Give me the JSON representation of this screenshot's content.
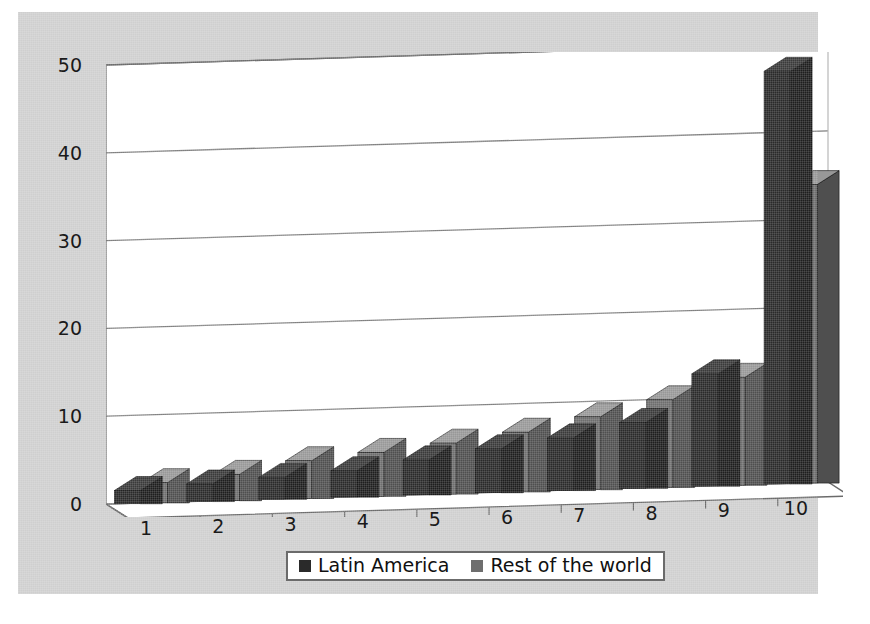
{
  "chart_data": {
    "type": "bar",
    "title": "",
    "subtitle": "",
    "xlabel": "",
    "ylabel": "",
    "categories": [
      "1",
      "2",
      "3",
      "4",
      "5",
      "6",
      "7",
      "8",
      "9",
      "10"
    ],
    "series": [
      {
        "name": "Latin America",
        "color": "#2a2a2a",
        "values": [
          1.5,
          2.0,
          2.5,
          3.0,
          4.0,
          5.0,
          6.0,
          7.5,
          12.8,
          47.0
        ]
      },
      {
        "name": "Rest of the world",
        "color": "#6e6e6e",
        "values": [
          2.3,
          3.0,
          4.3,
          5.0,
          5.8,
          6.8,
          8.3,
          10.0,
          12.3,
          34.0
        ]
      }
    ],
    "ylim": [
      0,
      50
    ],
    "yticks": [
      0,
      10,
      20,
      30,
      40,
      50
    ],
    "ytick_labels": [
      "0",
      "10",
      "20",
      "30",
      "40",
      "50"
    ],
    "grid": true,
    "legend_position": "bottom",
    "style": "3d-bar",
    "background": "#cfcfcf",
    "plot_background": "#ffffff",
    "axis_color": "#6b6b6b",
    "grid_color": "#808080"
  },
  "legend": {
    "items": [
      {
        "label": "Latin America",
        "swatch": "#2a2a2a",
        "icon": "square-swatch"
      },
      {
        "label": "Rest of the world",
        "swatch": "#6e6e6e",
        "icon": "square-swatch"
      }
    ]
  }
}
